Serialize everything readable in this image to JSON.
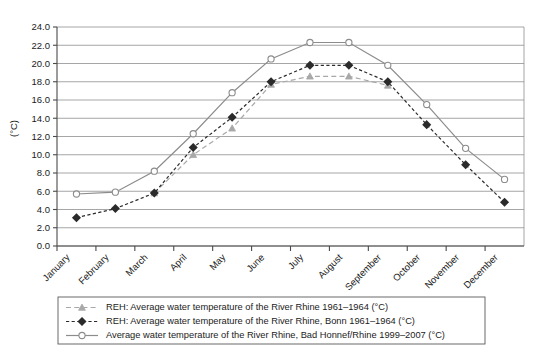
{
  "chart_data": {
    "type": "line",
    "title": "",
    "xlabel": "",
    "ylabel": "(°C)",
    "ylim": [
      0.0,
      24.0
    ],
    "ytick_step": 2.0,
    "grid": true,
    "legend_position": "bottom",
    "categories": [
      "January",
      "February",
      "March",
      "April",
      "May",
      "June",
      "July",
      "August",
      "September",
      "October",
      "November",
      "December"
    ],
    "ytick_labels": [
      "0.0",
      "2.0",
      "4.0",
      "6.0",
      "8.0",
      "10.0",
      "12.0",
      "14.0",
      "16.0",
      "18.0",
      "20.0",
      "22.0",
      "24.0"
    ],
    "series": [
      {
        "name": "REH: Average water temperature of the River Rhine 1961–1964 (°C)",
        "marker": "triangle",
        "line_style": "dashed",
        "color": "#a8a8a8",
        "values": [
          null,
          null,
          5.8,
          10.0,
          12.9,
          17.7,
          18.6,
          18.6,
          17.6,
          null,
          null,
          null
        ]
      },
      {
        "name": "REH: Average water temperature of the River Rhine, Bonn 1961–1964 (°C)",
        "marker": "diamond",
        "line_style": "dotted",
        "color": "#2b2b2b",
        "values": [
          3.1,
          4.1,
          5.8,
          10.8,
          14.1,
          18.0,
          19.8,
          19.8,
          18.0,
          13.3,
          8.9,
          4.8
        ]
      },
      {
        "name": "Average water temperature of the River Rhine, Bad Honnef/Rhine 1999–2007 (°C)",
        "marker": "open-circle",
        "line_style": "solid",
        "color": "#8c8c8c",
        "values": [
          5.7,
          5.9,
          8.2,
          12.3,
          16.8,
          20.5,
          22.3,
          22.3,
          19.8,
          15.5,
          10.7,
          7.3
        ]
      }
    ]
  },
  "legend": {
    "items": [
      {
        "label": "REH: Average water temperature of the River Rhine 1961–1964 (°C)",
        "marker": "triangle"
      },
      {
        "label": "REH: Average water temperature of the River Rhine, Bonn 1961–1964 (°C)",
        "marker": "diamond"
      },
      {
        "label": "Average water temperature of the River Rhine, Bad Honnef/Rhine 1999–2007 (°C)",
        "marker": "open-circle"
      }
    ]
  }
}
